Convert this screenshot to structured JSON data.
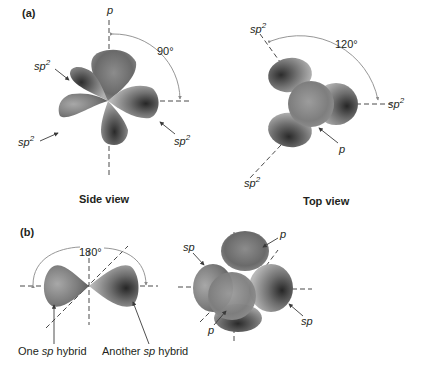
{
  "figure": {
    "panel_a": {
      "label": "(a)",
      "side_view": {
        "caption": "Side view",
        "axis_label_top": "p",
        "angle_label": "90°",
        "hybrid_labels": [
          {
            "base": "sp",
            "sup": "2",
            "position": "upper-left"
          },
          {
            "base": "sp",
            "sup": "2",
            "position": "lower-left"
          },
          {
            "base": "sp",
            "sup": "2",
            "position": "lower-right"
          }
        ]
      },
      "top_view": {
        "caption": "Top view",
        "angle_label": "120°",
        "p_label": "p",
        "hybrid_labels": [
          {
            "base": "sp",
            "sup": "2",
            "position": "upper-left"
          },
          {
            "base": "sp",
            "sup": "2",
            "position": "right"
          },
          {
            "base": "sp",
            "sup": "2",
            "position": "lower-left"
          }
        ]
      }
    },
    "panel_b": {
      "label": "(b)",
      "linear": {
        "angle_label": "180°",
        "left_caption_pre": "One ",
        "left_caption_it": "sp",
        "left_caption_post": " hybrid",
        "right_caption_pre": "Another ",
        "right_caption_it": "sp",
        "right_caption_post": " hybrid"
      },
      "sp_3d": {
        "labels": [
          {
            "text": "sp",
            "position": "upper-left"
          },
          {
            "text": "p",
            "position": "top-right"
          },
          {
            "text": "p",
            "position": "bottom-left"
          },
          {
            "text": "sp",
            "position": "right"
          }
        ]
      }
    },
    "colors": {
      "lobe_dark": "#2e2e2e",
      "lobe_mid": "#7a7a7a",
      "lobe_light": "#c4c4c4",
      "text": "#231f20",
      "arc": "#8a8a8a"
    }
  }
}
